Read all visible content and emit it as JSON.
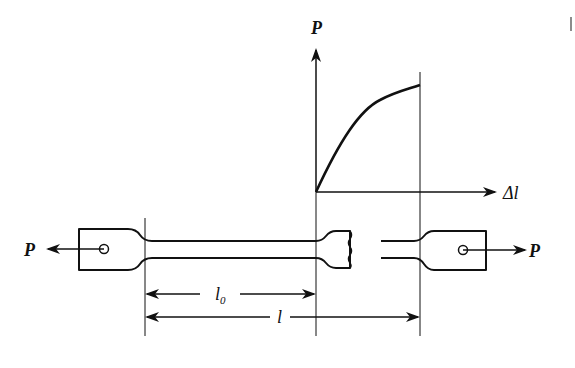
{
  "figure": {
    "graph": {
      "y_axis_label": "P",
      "x_axis_label": "Δl",
      "curve": "load vs elongation, concave-down rising to fracture"
    },
    "specimen": {
      "left_load_label": "P",
      "right_load_label": "P",
      "gauge_length_label": "l",
      "gauge_length_subscript": "0",
      "final_length_label": "l"
    },
    "colors": {
      "ink": "#111111",
      "background": "#ffffff"
    }
  }
}
